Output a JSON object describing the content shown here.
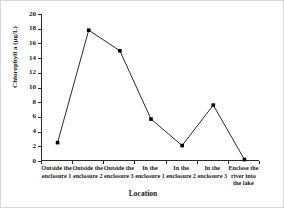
{
  "chart_data": {
    "type": "line",
    "title": "",
    "xlabel": "Location",
    "ylabel": "Chlorophyll a (μg/L)",
    "categories": [
      "Outside the enclosure 1",
      "Outside the enclosure 2",
      "Outside the enclosure 3",
      "In the enclosure 1",
      "In the enclosure 2",
      "In the enclosure 3",
      "Enclose the river into the lake"
    ],
    "category_lines": [
      [
        "Outside the",
        "enclosure 1"
      ],
      [
        "Outside the",
        "enclosure 2"
      ],
      [
        "Outside the",
        "enclosure 3"
      ],
      [
        "In the",
        "enclosure 1"
      ],
      [
        "In the",
        "enclosure 2"
      ],
      [
        "In the",
        "enclosure 3"
      ],
      [
        "Enclose the",
        "river into",
        "the lake"
      ]
    ],
    "values": [
      2.5,
      17.8,
      15.0,
      5.7,
      2.1,
      7.6,
      0.2
    ],
    "ylim": [
      0,
      20
    ],
    "ytick_labels": [
      "0",
      "2",
      "4",
      "6",
      "8",
      "10",
      "12",
      "14",
      "16",
      "18",
      "20"
    ],
    "ytick_values": [
      0,
      2,
      4,
      6,
      8,
      10,
      12,
      14,
      16,
      18,
      20
    ],
    "grid": false,
    "legend": false,
    "marker": "square",
    "line_color": "#2a2a2a",
    "marker_color": "#000000",
    "axis_color": "#2a2a2a",
    "background_color": "#ffffff"
  }
}
